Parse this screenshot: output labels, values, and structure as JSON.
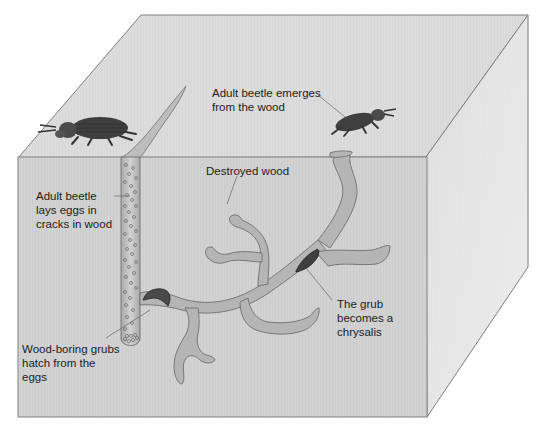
{
  "figure": {
    "colors": {
      "top_face": "#d9d9d9",
      "front_face": "#cfcfcf",
      "side_face": "#e4e4e4",
      "edge": "#7a7a7a",
      "tunnel_fill": "#b8b8b8",
      "tunnel_edge": "#6f6f6f",
      "beetle": "#3f3f3f",
      "grub": "#4a4a4a",
      "text": "#1d1d1d"
    }
  },
  "labels": {
    "emerges": {
      "lines": [
        "Adult beetle emerges",
        "from the wood"
      ]
    },
    "destroyed": {
      "lines": [
        "Destroyed wood"
      ]
    },
    "lays_eggs": {
      "lines": [
        "Adult beetle",
        "lays eggs in",
        "cracks in wood"
      ]
    },
    "hatch": {
      "lines": [
        "Wood-boring grubs",
        "hatch from the",
        "eggs"
      ]
    },
    "chrysalis": {
      "lines": [
        "The grub",
        "becomes a",
        "chrysalis"
      ]
    }
  }
}
